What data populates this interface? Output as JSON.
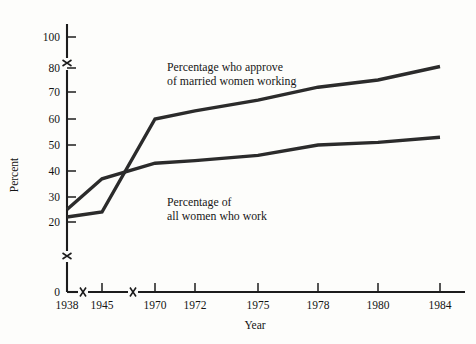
{
  "chart_data": {
    "type": "line",
    "title": "",
    "xlabel": "Year",
    "ylabel": "Percent",
    "grid": false,
    "legend_position": "inline-annotations",
    "x": [
      1938,
      1945,
      1970,
      1972,
      1975,
      1978,
      1980,
      1984
    ],
    "x_tick_labels": [
      "1938",
      "1945",
      "1970",
      "1972",
      "1975",
      "1978",
      "1980",
      "1984"
    ],
    "y_tick_labels": [
      "0",
      "20",
      "30",
      "40",
      "50",
      "60",
      "70",
      "80",
      "100"
    ],
    "y_tick_values": [
      0,
      20,
      30,
      40,
      50,
      60,
      70,
      80,
      100
    ],
    "ylim": [
      0,
      100
    ],
    "y_axis_breaks": [
      "between 0 and 20",
      "between 80 and 100"
    ],
    "x_axis_breaks": [
      "between 1938 and 1945",
      "between 1945 and 1970"
    ],
    "series": [
      {
        "name": "Percentage who approve of married women working",
        "annotation_line1": "Percentage who approve",
        "annotation_line2": "of married women working",
        "color": "#2b2b2b",
        "x": [
          1938,
          1945,
          1970,
          1972,
          1975,
          1978,
          1980,
          1984
        ],
        "values": [
          22,
          24,
          60,
          63,
          67,
          72,
          75,
          81
        ]
      },
      {
        "name": "Percentage of all women who work",
        "annotation_line1": "Percentage of",
        "annotation_line2": "all women who work",
        "color": "#2b2b2b",
        "x": [
          1938,
          1945,
          1970,
          1972,
          1975,
          1978,
          1980,
          1984
        ],
        "values": [
          25,
          37,
          43,
          44,
          46,
          50,
          51,
          53
        ]
      }
    ]
  },
  "axes": {
    "y_label": "Percent",
    "x_label": "Year",
    "y_ticks": [
      "100",
      "80",
      "70",
      "60",
      "50",
      "40",
      "30",
      "20",
      "0"
    ],
    "x_ticks": [
      "1938",
      "1945",
      "1970",
      "1972",
      "1975",
      "1978",
      "1980",
      "1984"
    ]
  },
  "annotations": {
    "upper": {
      "line1": "Percentage who approve",
      "line2": "of married women working"
    },
    "lower": {
      "line1": "Percentage of",
      "line2": "all women who work"
    }
  }
}
